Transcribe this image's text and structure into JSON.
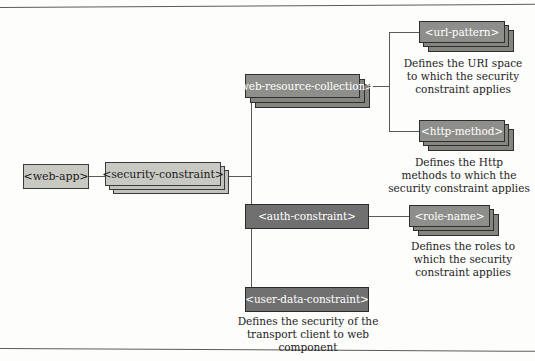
{
  "diagram": {
    "colors": {
      "light_fill": "#c9c9c4",
      "mid_fill": "#8e8e8a",
      "dark_fill": "#707070",
      "line": "#5a5a5a",
      "text_dark": "#1a1a1a",
      "text_light": "#ffffff",
      "background": "#fdfdfc"
    },
    "nodes": {
      "web_app": {
        "label": "<web-app>",
        "style": "light",
        "stacked": false
      },
      "security_constraint": {
        "label": "<security-constraint>",
        "style": "light",
        "stacked": true
      },
      "web_resource_collection": {
        "label": "<web-resource-collection>",
        "style": "mid",
        "stacked": true
      },
      "url_pattern": {
        "label": "<url-pattern>",
        "style": "mid",
        "stacked": true
      },
      "http_method": {
        "label": "<http-method>",
        "style": "mid",
        "stacked": true
      },
      "auth_constraint": {
        "label": "<auth-constraint>",
        "style": "dark",
        "stacked": false
      },
      "role_name": {
        "label": "<role-name>",
        "style": "mid",
        "stacked": true
      },
      "user_data_constraint": {
        "label": "<user-data-constraint>",
        "style": "dark",
        "stacked": false
      }
    },
    "captions": {
      "url_pattern": "Defines the URI space to which the security constraint applies",
      "http_method": "Defines the Http methods to which the security constraint applies",
      "role_name": "Defines the roles to which the security constraint applies",
      "user_data_constraint": "Defines the security of the transport client to web component"
    },
    "caption_lines": {
      "url_pattern": [
        "Defines the URI space",
        "to which the security",
        "constraint applies"
      ],
      "http_method": [
        "Defines the Http",
        "methods to which the",
        "security constraint applies"
      ],
      "role_name": [
        "Defines the roles to",
        "which the security",
        "constraint applies"
      ],
      "user_data_constraint": [
        "Defines the security of the",
        "transport client to web",
        "component"
      ]
    }
  }
}
